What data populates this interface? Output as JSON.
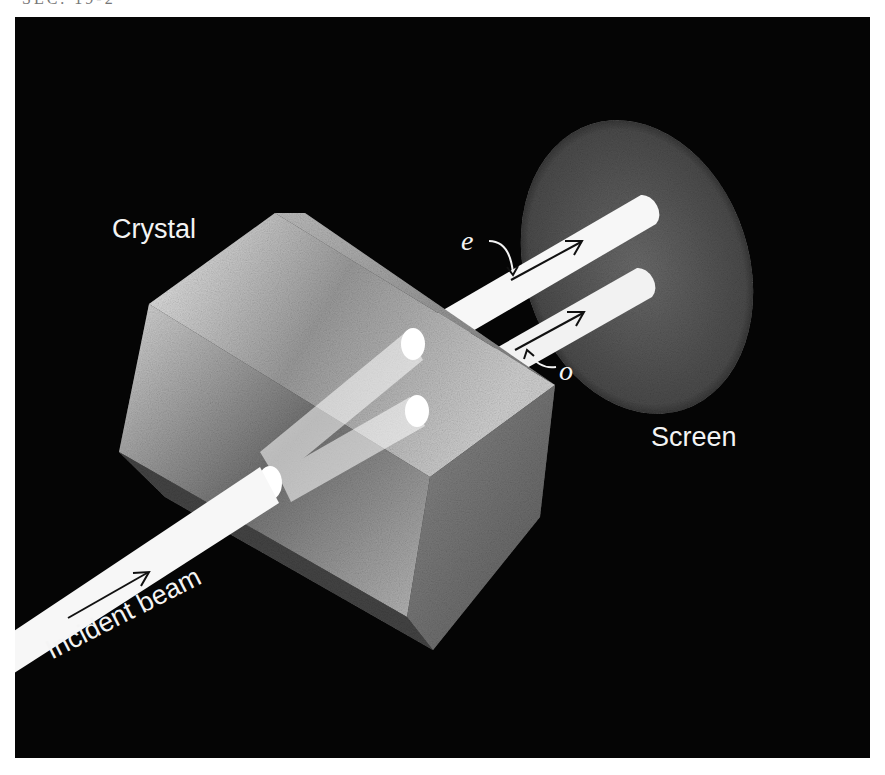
{
  "header": {
    "fragment": "SEC. 19-2"
  },
  "figure": {
    "background_color": "#050505",
    "foreground_color": "#f4f4f4",
    "labels": {
      "crystal": "Crystal",
      "screen": "Screen",
      "incident_beam": "Incident beam",
      "extraordinary_ray": "e",
      "ordinary_ray": "o"
    },
    "elements": [
      {
        "name": "crystal",
        "shape": "rectangular block (calcite crystal)"
      },
      {
        "name": "screen",
        "shape": "elliptical disc"
      },
      {
        "name": "incident-beam",
        "shape": "single light rod entering crystal"
      },
      {
        "name": "e-ray",
        "shape": "emergent rod (upper)"
      },
      {
        "name": "o-ray",
        "shape": "emergent rod (lower)"
      }
    ]
  }
}
